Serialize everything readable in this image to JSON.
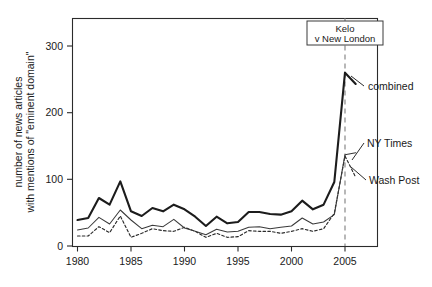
{
  "chart_data": {
    "type": "line",
    "title": "",
    "xlabel": "",
    "ylabel": "number of news articles\nwith mentions of \"eminent domain\"",
    "ylabel_line1": "number of news articles",
    "ylabel_line2": "with mentions of \"eminent domain\"",
    "xlim": [
      1979.2,
      2006.6
    ],
    "ylim": [
      -8,
      342
    ],
    "grid": false,
    "legend_position": "right-inline-labels",
    "x_ticks": [
      1980,
      1985,
      1990,
      1995,
      2000,
      2005
    ],
    "x_tick_labels": [
      "1980",
      "1985",
      "1990",
      "1995",
      "2000",
      "2005"
    ],
    "y_ticks": [
      0,
      100,
      200,
      300
    ],
    "y_tick_labels": [
      "0",
      "100",
      "200",
      "300"
    ],
    "x": [
      1980,
      1981,
      1982,
      1983,
      1984,
      1985,
      1986,
      1987,
      1988,
      1989,
      1990,
      1991,
      1992,
      1993,
      1994,
      1995,
      1996,
      1997,
      1998,
      1999,
      2000,
      2001,
      2002,
      2003,
      2004,
      2005,
      2006
    ],
    "series": [
      {
        "name": "combined",
        "style": "thick-solid",
        "color": "#1c1c1c",
        "label": "combined",
        "values": [
          39,
          42,
          72,
          62,
          97,
          52,
          45,
          57,
          52,
          62,
          55,
          44,
          30,
          44,
          34,
          36,
          51,
          51,
          48,
          47,
          52,
          68,
          55,
          62,
          96,
          260,
          243
        ]
      },
      {
        "name": "NY Times",
        "style": "thin-solid",
        "color": "#3a3a3a",
        "label": "NY Times",
        "values": [
          24,
          27,
          43,
          33,
          54,
          39,
          26,
          31,
          29,
          40,
          27,
          22,
          17,
          25,
          21,
          22,
          28,
          29,
          26,
          28,
          30,
          42,
          33,
          36,
          47,
          137,
          140
        ]
      },
      {
        "name": "Wash Post",
        "style": "dashed",
        "color": "#2b2b2b",
        "label": "Wash Post",
        "values": [
          15,
          15,
          29,
          20,
          45,
          13,
          19,
          26,
          23,
          22,
          28,
          22,
          13,
          19,
          13,
          14,
          23,
          22,
          22,
          19,
          22,
          26,
          22,
          26,
          49,
          135,
          103
        ]
      }
    ],
    "annotations": [
      {
        "name": "kelo-event",
        "type": "vertical-line-with-box",
        "x": 2005,
        "line_color": "#9a9a9a",
        "label_line1": "Kelo",
        "label_line2": "v New London"
      }
    ]
  }
}
